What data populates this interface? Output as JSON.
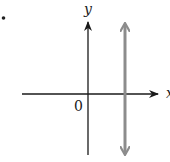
{
  "diagram": {
    "type": "coordinate-plane",
    "bullet": "•",
    "axes": {
      "x_label": "x",
      "y_label": "y",
      "origin_label": "0",
      "axis_color": "#1a1a1a"
    },
    "vertical_line": {
      "description": "vertical line to the right of the y-axis, extending in both directions",
      "color": "#8c8c8c",
      "arrows": "both"
    }
  }
}
